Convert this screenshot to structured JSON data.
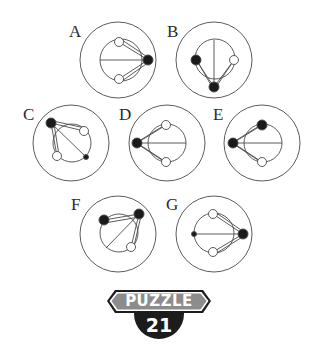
{
  "puzzle": {
    "badge_title": "PUZZLE",
    "badge_number": "21",
    "colors": {
      "line": "#4a4a4a",
      "filled": "#1a1a1a",
      "badge_fill": "#8c8c8c",
      "badge_circle": "#1c1c1c"
    },
    "figures": [
      {
        "label": "A",
        "label_pos": [
          69,
          23
        ]
      },
      {
        "label": "B",
        "label_pos": [
          167,
          23
        ]
      },
      {
        "label": "C",
        "label_pos": [
          23,
          106
        ]
      },
      {
        "label": "D",
        "label_pos": [
          119,
          106
        ]
      },
      {
        "label": "E",
        "label_pos": [
          213,
          106
        ]
      },
      {
        "label": "F",
        "label_pos": [
          71,
          196
        ]
      },
      {
        "label": "G",
        "label_pos": [
          166,
          196
        ]
      }
    ]
  }
}
